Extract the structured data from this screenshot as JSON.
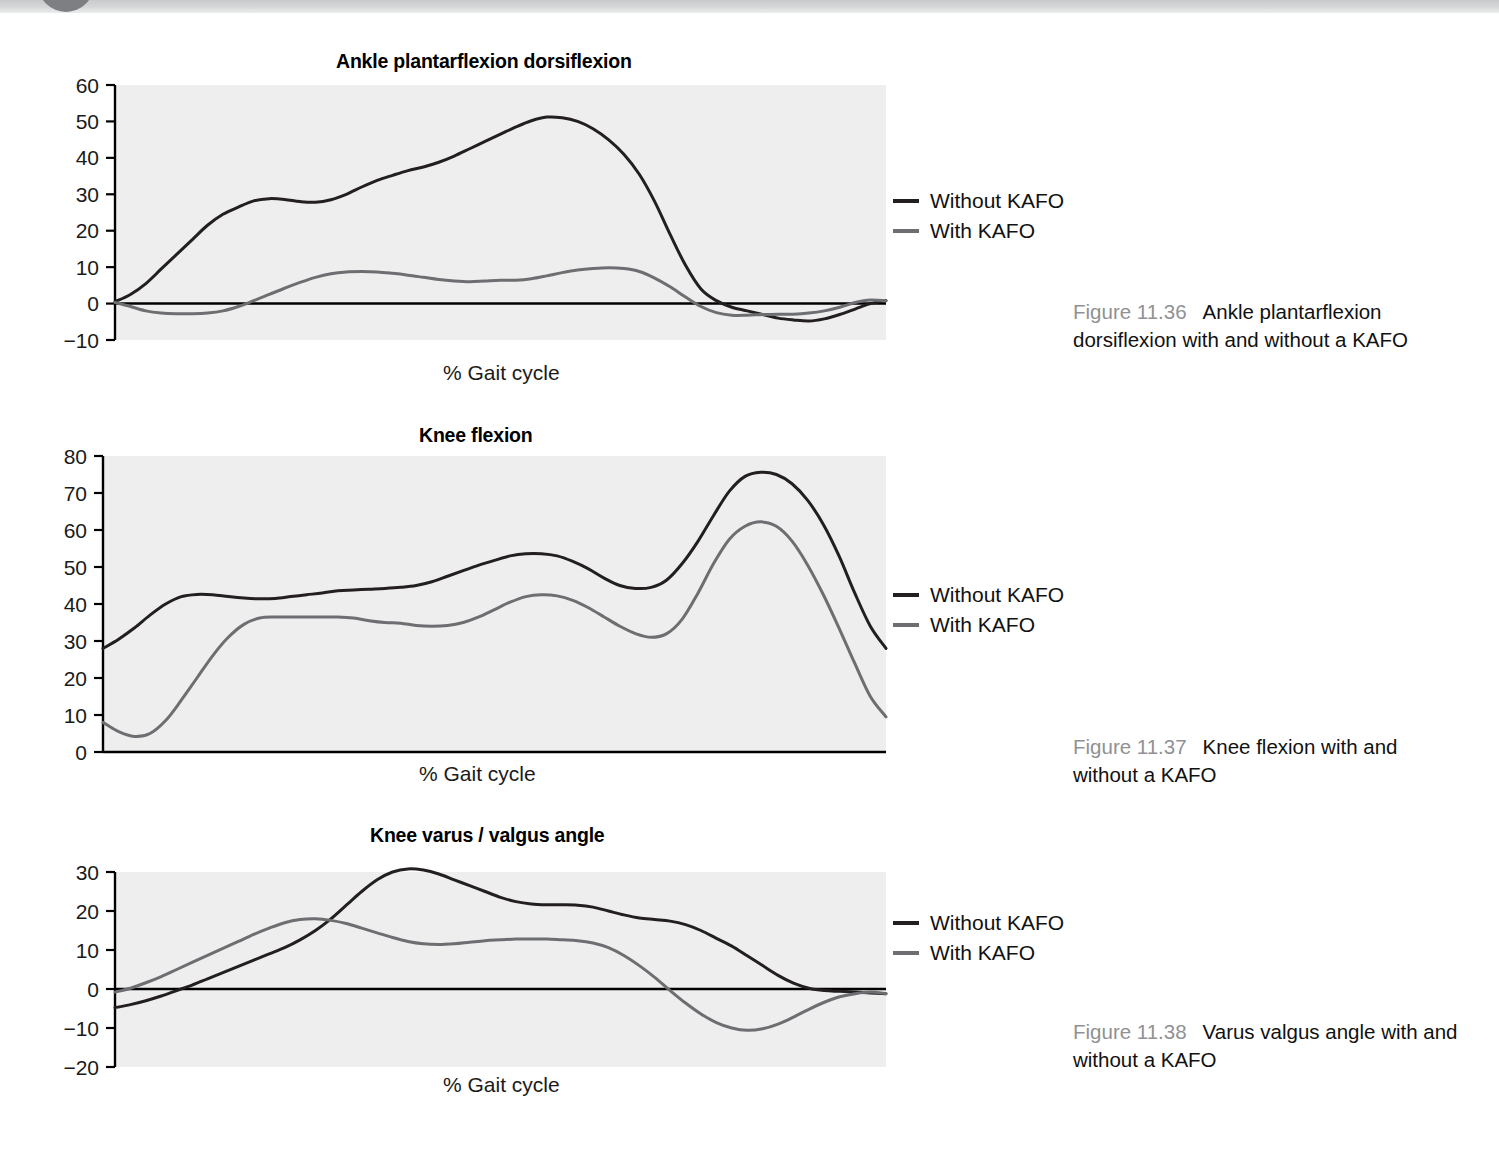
{
  "page": {
    "banner_present": true
  },
  "colors": {
    "plot_background": "#eeeeee",
    "without_kafo_line": "#231f20",
    "with_kafo_line": "#6d6e71",
    "axis": "#000000",
    "caption_number": "#8f9194",
    "text": "#111111"
  },
  "legend_common": {
    "without_label": "Without KAFO",
    "with_label": "With KAFO"
  },
  "figures": [
    {
      "id": "fig-11-36",
      "title": "Ankle plantarflexion dorsiflexion",
      "xlabel": "% Gait cycle",
      "caption_number": "Figure 11.36",
      "caption_text": "Ankle plantarflexion dorsiflexion with and without a KAFO"
    },
    {
      "id": "fig-11-37",
      "title": "Knee flexion",
      "xlabel": "% Gait cycle",
      "caption_number": "Figure 11.37",
      "caption_text": "Knee flexion with and without a KAFO"
    },
    {
      "id": "fig-11-38",
      "title": "Knee varus / valgus angle",
      "xlabel": "% Gait cycle",
      "caption_number": "Figure 11.38",
      "caption_text": "Varus valgus angle with and without a KAFO"
    }
  ],
  "chart_data": [
    {
      "type": "line",
      "title": "Ankle plantarflexion dorsiflexion",
      "xlabel": "% Gait cycle",
      "ylabel": "",
      "yticks": [
        60,
        50,
        40,
        30,
        20,
        10,
        0,
        -10
      ],
      "ylim": [
        -10,
        60
      ],
      "xlim": [
        0,
        100
      ],
      "grid": false,
      "zero_line": true,
      "legend_position": "right",
      "x": [
        0,
        2,
        4,
        6,
        8,
        10,
        12,
        14,
        16,
        18,
        20,
        22,
        24,
        26,
        28,
        30,
        32,
        34,
        36,
        38,
        40,
        42,
        44,
        46,
        48,
        50,
        52,
        54,
        56,
        58,
        60,
        62,
        64,
        66,
        68,
        70,
        72,
        74,
        76,
        78,
        80,
        82,
        84,
        86,
        88,
        90,
        92,
        94,
        96,
        98,
        100
      ],
      "series": [
        {
          "name": "Without KAFO",
          "color": "#231f20",
          "values": [
            0.5,
            2.5,
            5.5,
            9.5,
            13.5,
            17.5,
            21.5,
            24.5,
            26.5,
            28.2,
            28.8,
            28.6,
            28.0,
            27.8,
            28.5,
            30.0,
            32.0,
            33.8,
            35.2,
            36.5,
            37.5,
            38.8,
            40.5,
            42.5,
            44.5,
            46.5,
            48.5,
            50.2,
            51.2,
            51.0,
            50.0,
            48.0,
            45.0,
            41.0,
            35.5,
            28.0,
            19.0,
            10.5,
            4.0,
            0.8,
            -1.0,
            -2.0,
            -3.0,
            -4.0,
            -4.5,
            -4.8,
            -4.2,
            -3.0,
            -1.5,
            0.0,
            0.8
          ]
        },
        {
          "name": "With KAFO",
          "color": "#6d6e71",
          "values": [
            0.3,
            -0.8,
            -2.0,
            -2.6,
            -2.8,
            -2.8,
            -2.6,
            -2.0,
            -0.8,
            0.8,
            2.5,
            4.2,
            5.8,
            7.2,
            8.2,
            8.7,
            8.8,
            8.7,
            8.3,
            7.8,
            7.2,
            6.6,
            6.2,
            6.0,
            6.2,
            6.4,
            6.4,
            6.8,
            7.6,
            8.5,
            9.2,
            9.6,
            9.8,
            9.6,
            8.8,
            7.0,
            4.6,
            1.8,
            -0.8,
            -2.5,
            -3.2,
            -3.2,
            -3.0,
            -2.9,
            -2.9,
            -2.6,
            -2.0,
            -1.0,
            0.3,
            1.0,
            0.8
          ]
        }
      ]
    },
    {
      "type": "line",
      "title": "Knee flexion",
      "xlabel": "% Gait cycle",
      "ylabel": "",
      "yticks": [
        80,
        70,
        60,
        50,
        40,
        30,
        20,
        10,
        0
      ],
      "ylim": [
        0,
        80
      ],
      "xlim": [
        0,
        100
      ],
      "grid": false,
      "zero_line": false,
      "legend_position": "right",
      "x": [
        0,
        2,
        4,
        6,
        8,
        10,
        12,
        14,
        16,
        18,
        20,
        22,
        24,
        26,
        28,
        30,
        32,
        34,
        36,
        38,
        40,
        42,
        44,
        46,
        48,
        50,
        52,
        54,
        56,
        58,
        60,
        62,
        64,
        66,
        68,
        70,
        72,
        74,
        76,
        78,
        80,
        82,
        84,
        86,
        88,
        90,
        92,
        94,
        96,
        98,
        100
      ],
      "series": [
        {
          "name": "Without KAFO",
          "color": "#231f20",
          "values": [
            28.0,
            30.5,
            33.5,
            37.0,
            40.0,
            42.0,
            42.6,
            42.5,
            42.0,
            41.6,
            41.4,
            41.5,
            42.0,
            42.5,
            43.0,
            43.6,
            43.8,
            44.0,
            44.2,
            44.5,
            45.0,
            46.0,
            47.5,
            49.0,
            50.5,
            51.8,
            53.0,
            53.6,
            53.6,
            53.0,
            51.5,
            49.5,
            47.0,
            45.0,
            44.2,
            44.5,
            46.5,
            51.0,
            57.0,
            64.0,
            70.5,
            74.5,
            75.6,
            75.0,
            72.5,
            68.0,
            61.5,
            53.0,
            43.0,
            34.0,
            28.0
          ]
        },
        {
          "name": "With KAFO",
          "color": "#6d6e71",
          "values": [
            8.0,
            5.5,
            4.2,
            5.0,
            8.5,
            14.0,
            20.0,
            26.0,
            31.0,
            34.5,
            36.2,
            36.5,
            36.5,
            36.5,
            36.5,
            36.5,
            36.2,
            35.5,
            35.0,
            34.8,
            34.2,
            34.0,
            34.2,
            35.0,
            36.5,
            38.5,
            40.5,
            42.0,
            42.5,
            42.2,
            41.0,
            39.0,
            36.5,
            34.0,
            32.0,
            31.0,
            32.0,
            36.0,
            43.0,
            51.0,
            57.5,
            61.0,
            62.2,
            61.0,
            57.0,
            50.5,
            42.5,
            33.5,
            24.0,
            15.0,
            9.5
          ]
        }
      ]
    },
    {
      "type": "line",
      "title": "Knee varus / valgus angle",
      "xlabel": "% Gait cycle",
      "ylabel": "",
      "yticks": [
        30,
        20,
        10,
        0,
        -10,
        -20
      ],
      "ylim": [
        -20,
        30
      ],
      "xlim": [
        0,
        100
      ],
      "grid": false,
      "zero_line": true,
      "legend_position": "right",
      "x": [
        0,
        2,
        4,
        6,
        8,
        10,
        12,
        14,
        16,
        18,
        20,
        22,
        24,
        26,
        28,
        30,
        32,
        34,
        36,
        38,
        40,
        42,
        44,
        46,
        48,
        50,
        52,
        54,
        56,
        58,
        60,
        62,
        64,
        66,
        68,
        70,
        72,
        74,
        76,
        78,
        80,
        82,
        84,
        86,
        88,
        90,
        92,
        94,
        96,
        98,
        100
      ],
      "series": [
        {
          "name": "Without KAFO",
          "color": "#231f20",
          "values": [
            -4.8,
            -4.0,
            -3.0,
            -1.8,
            -0.4,
            1.0,
            2.6,
            4.2,
            5.8,
            7.4,
            9.0,
            10.6,
            12.6,
            15.0,
            18.0,
            21.5,
            25.0,
            28.0,
            30.0,
            30.8,
            30.5,
            29.5,
            28.0,
            26.5,
            25.0,
            23.5,
            22.4,
            21.8,
            21.6,
            21.6,
            21.5,
            21.0,
            20.0,
            19.0,
            18.2,
            17.8,
            17.4,
            16.5,
            15.0,
            13.0,
            11.0,
            8.5,
            6.0,
            3.5,
            1.5,
            0.2,
            -0.4,
            -0.6,
            -0.8,
            -1.0,
            -1.2
          ]
        },
        {
          "name": "With KAFO",
          "color": "#6d6e71",
          "values": [
            -0.8,
            0.2,
            1.6,
            3.2,
            5.0,
            6.8,
            8.6,
            10.4,
            12.2,
            14.0,
            15.6,
            17.0,
            17.8,
            18.0,
            17.6,
            16.8,
            15.6,
            14.4,
            13.2,
            12.2,
            11.6,
            11.4,
            11.6,
            12.0,
            12.4,
            12.6,
            12.8,
            12.8,
            12.8,
            12.6,
            12.4,
            11.8,
            10.6,
            8.6,
            6.0,
            3.0,
            -0.4,
            -3.6,
            -6.4,
            -8.6,
            -10.0,
            -10.6,
            -10.2,
            -9.0,
            -7.2,
            -5.2,
            -3.4,
            -2.0,
            -1.2,
            -0.8,
            -1.2
          ]
        }
      ]
    }
  ]
}
